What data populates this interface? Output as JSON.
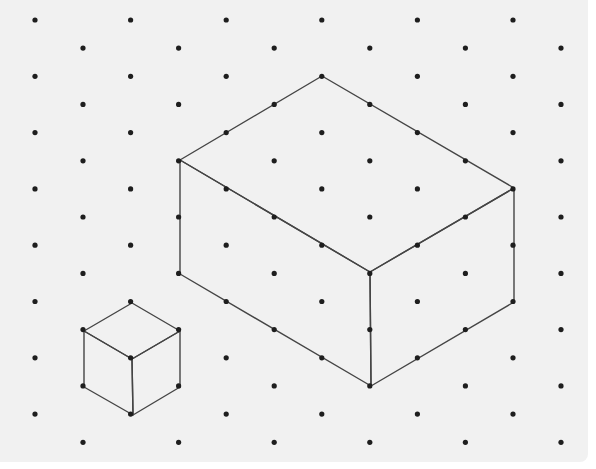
{
  "diagram": {
    "type": "isometric-dot-grid",
    "colors": {
      "paper": "#f1f1f1",
      "dot": "#1e1e1e",
      "edge": "#454545"
    },
    "grid": {
      "rows": 16,
      "row_y0": 20,
      "row_step": 28.15,
      "even_row_x0": 35,
      "odd_row_x0": 83,
      "col_step": 95.6,
      "cols_per_row": 6,
      "dot_radius": 2.6
    },
    "shapes": [
      {
        "name": "large-cuboid",
        "dimensions": {
          "width": 3,
          "depth": 4,
          "height": 4
        },
        "faces": {
          "top": [
            [
              322,
              76
            ],
            [
              514,
              188
            ],
            [
              370,
              272
            ],
            [
              180,
              160
            ]
          ],
          "left": [
            [
              180,
              160
            ],
            [
              370,
              272
            ],
            [
              371,
              386
            ],
            [
              180,
              274
            ]
          ],
          "right": [
            [
              370,
              272
            ],
            [
              514,
              188
            ],
            [
              514,
              302
            ],
            [
              371,
              386
            ]
          ]
        }
      },
      {
        "name": "small-cube",
        "dimensions": {
          "width": 1,
          "depth": 1,
          "height": 2
        },
        "faces": {
          "top": [
            [
              132,
              303
            ],
            [
              180,
              331
            ],
            [
              132,
              359
            ],
            [
              84,
              331
            ]
          ],
          "left": [
            [
              84,
              331
            ],
            [
              132,
              359
            ],
            [
              133,
              415
            ],
            [
              84,
              387
            ]
          ],
          "right": [
            [
              132,
              359
            ],
            [
              180,
              331
            ],
            [
              180,
              387
            ],
            [
              133,
              415
            ]
          ]
        }
      }
    ]
  }
}
